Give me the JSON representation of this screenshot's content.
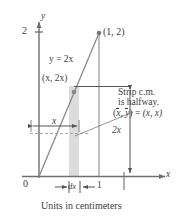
{
  "figure": {
    "type": "math-diagram",
    "caption": "Units in centimeters",
    "axes": {
      "x_axis_label": "x",
      "y_axis_label": "y",
      "origin_label": "0",
      "y_tick_label": "2",
      "x_tick_label": "1"
    },
    "curve": {
      "equation_label": "y = 2x",
      "slope": 2,
      "from": [
        0,
        0
      ],
      "to": [
        1,
        2
      ]
    },
    "points": [
      {
        "name": "endpoint",
        "label": "(1, 2)",
        "coords": [
          1,
          2
        ]
      },
      {
        "name": "strip-top",
        "label": "(x, 2x)",
        "coords": [
          0.5,
          1
        ]
      }
    ],
    "annotations": {
      "strip_width_label": "dx",
      "horizontal_extent_label": "x",
      "vertical_extent_label": "2x",
      "note_line1": "Strip c.m.",
      "note_line2": "is halfway.",
      "note_line3_left": "(x, y) = (x, x)",
      "note_line3_x_bar": "x",
      "note_line3_y_bar": "y",
      "note_line3_rhs": "(x, x)"
    },
    "colors": {
      "ink": "#3d3d3d",
      "axis": "#6f6f6f",
      "strip_fill": "#d9d9d9",
      "dashed": "#9a9a9a",
      "background": "#ffffff"
    }
  }
}
